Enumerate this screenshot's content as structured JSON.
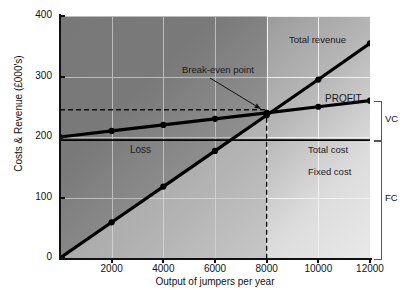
{
  "chart_data": {
    "type": "line",
    "title": "",
    "xlabel": "Output of jumpers per year",
    "ylabel": "Costs & Revenue (£000's)",
    "xlim": [
      0,
      12000
    ],
    "ylim": [
      0,
      400
    ],
    "xticks": [
      2000,
      4000,
      6000,
      8000,
      10000,
      12000
    ],
    "xtick_labels": [
      "2000",
      "4000",
      "6000",
      "8000",
      "10000",
      "12000"
    ],
    "yticks": [
      0,
      100,
      200,
      300,
      400
    ],
    "ytick_labels": [
      "0",
      "100",
      "200",
      "300",
      "400"
    ],
    "grid": true,
    "legend": "inline-labels",
    "series": [
      {
        "name": "Total revenue",
        "x": [
          0,
          2000,
          4000,
          6000,
          8000,
          10000,
          12000
        ],
        "values": [
          0,
          59,
          118,
          177,
          236,
          295,
          355
        ],
        "markers": true
      },
      {
        "name": "Total cost",
        "x": [
          0,
          2000,
          4000,
          6000,
          8000,
          10000,
          12000
        ],
        "values": [
          200,
          210,
          220,
          230,
          240,
          250,
          260
        ],
        "markers": true
      },
      {
        "name": "Fixed cost",
        "x": [
          0,
          12000
        ],
        "values": [
          195,
          195
        ],
        "markers": false
      }
    ],
    "annotations": [
      {
        "name": "break-even-point",
        "label": "Break-even point",
        "x": 8000,
        "y": 240
      },
      {
        "name": "profit-region",
        "label": "PROFIT"
      },
      {
        "name": "loss-region",
        "label": "Loss"
      },
      {
        "name": "total-revenue-label",
        "label": "Total revenue"
      },
      {
        "name": "total-cost-label",
        "label": "Total cost"
      },
      {
        "name": "fixed-cost-label",
        "label": "Fixed cost"
      }
    ],
    "guides": [
      {
        "name": "break-even-vertical",
        "style": "dashed",
        "x": 8000
      },
      {
        "name": "break-even-horizontal",
        "style": "dashed",
        "y": 245
      }
    ],
    "brackets": [
      {
        "name": "variable-cost-bracket",
        "label": "VC",
        "from": 195,
        "to": 260
      },
      {
        "name": "fixed-cost-bracket",
        "label": "FC",
        "from": 0,
        "to": 195
      }
    ],
    "colors": {
      "line": "#000000",
      "grid": "#f0f0f0",
      "plot_dark": "#8f8f8f",
      "plot_light": "#e9e9e9",
      "axis": "#111111"
    }
  },
  "axis": {
    "y_title": "Costs & Revenue (£000's)",
    "x_title": "Output of jumpers per year"
  },
  "labels": {
    "total_revenue": "Total revenue",
    "total_cost": "Total cost",
    "fixed_cost": "Fixed cost",
    "profit": "PROFIT",
    "loss": "Loss",
    "break_even": "Break-even point",
    "vc": "VC",
    "fc": "FC"
  }
}
